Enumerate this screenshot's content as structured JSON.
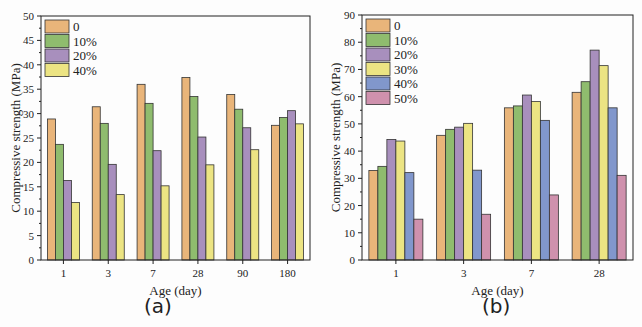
{
  "chart_data": [
    {
      "type": "bar",
      "panel": "(a)",
      "title": "",
      "xlabel": "Age (day)",
      "ylabel": "Compressive strength (MPa)",
      "ylim": [
        0,
        50
      ],
      "yticks": [
        0,
        5,
        10,
        15,
        20,
        25,
        30,
        35,
        40,
        45,
        50
      ],
      "grid": false,
      "legend_position": "upper-left",
      "categories": [
        "1",
        "3",
        "7",
        "28",
        "90",
        "180"
      ],
      "series": [
        {
          "name": "0",
          "color": "#e9b57a",
          "values": [
            28.9,
            31.4,
            36.0,
            37.4,
            33.9,
            27.6
          ]
        },
        {
          "name": "10%",
          "color": "#8fbc6e",
          "values": [
            23.7,
            28.0,
            32.1,
            33.5,
            30.9,
            29.2
          ]
        },
        {
          "name": "20%",
          "color": "#a88fbd",
          "values": [
            16.3,
            19.6,
            22.4,
            25.2,
            27.1,
            30.6
          ]
        },
        {
          "name": "40%",
          "color": "#ece483",
          "values": [
            11.8,
            13.4,
            15.2,
            19.5,
            22.6,
            27.9
          ]
        }
      ]
    },
    {
      "type": "bar",
      "panel": "(b)",
      "title": "",
      "xlabel": "Age (day)",
      "ylabel": "Compressive strength (MPa)",
      "ylim": [
        0,
        90
      ],
      "yticks": [
        0,
        10,
        20,
        30,
        40,
        50,
        60,
        70,
        80,
        90
      ],
      "grid": false,
      "legend_position": "upper-left",
      "categories": [
        "1",
        "3",
        "7",
        "28"
      ],
      "series": [
        {
          "name": "0",
          "color": "#e9b57a",
          "values": [
            32.9,
            45.8,
            55.9,
            61.6
          ]
        },
        {
          "name": "10%",
          "color": "#8fbc6e",
          "values": [
            34.4,
            48.0,
            56.6,
            65.5
          ]
        },
        {
          "name": "20%",
          "color": "#a88fbd",
          "values": [
            44.3,
            48.8,
            60.6,
            77.1
          ]
        },
        {
          "name": "30%",
          "color": "#ece483",
          "values": [
            43.7,
            50.2,
            58.2,
            71.4
          ]
        },
        {
          "name": "40%",
          "color": "#8197cc",
          "values": [
            32.1,
            33.0,
            51.3,
            55.9
          ]
        },
        {
          "name": "50%",
          "color": "#cf91ad",
          "values": [
            15.0,
            16.8,
            23.9,
            31.1
          ]
        }
      ]
    }
  ],
  "captions": {
    "a": "(a)",
    "b": "(b)"
  }
}
